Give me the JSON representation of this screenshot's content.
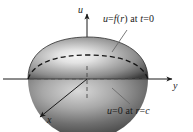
{
  "figure": {
    "type": "3d-dome-diagram",
    "background_color": "#ffffff",
    "ink_color": "#1b1b1b"
  },
  "axes": {
    "vertical": {
      "name": "u-axis",
      "label": "u",
      "direction": "up"
    },
    "right": {
      "name": "y-axis",
      "label": "y",
      "direction": "right"
    },
    "front": {
      "name": "x-axis",
      "label": "x",
      "direction": "down-left"
    }
  },
  "annotations": {
    "initial_condition": {
      "text": "u = f(r) at t = 0",
      "parts": {
        "u": "u",
        "eq1": "=",
        "f": "f",
        "open": "(",
        "r": "r",
        "close": ")",
        "at": "at",
        "t": "t",
        "eq2": "=",
        "zero": "0"
      }
    },
    "boundary_condition": {
      "text": "u = 0 at r = c",
      "parts": {
        "u": "u",
        "eq1": "=",
        "zero": "0",
        "at": "at",
        "r": "r",
        "eq2": "=",
        "c": "c"
      }
    }
  },
  "surface": {
    "name": "dome",
    "shading": "radial-gradient",
    "highlight_color": "#f2f2f2",
    "mid_color": "#9a9a9a",
    "edge_color": "#3a3a3a",
    "base_circle_style": "dashed-ellipse"
  }
}
